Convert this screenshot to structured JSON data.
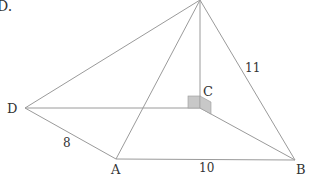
{
  "problem_marker": "D.",
  "diagram": {
    "type": "pyramid",
    "vertices": {
      "apex": {
        "label": "",
        "x": 200,
        "y": 0
      },
      "A": {
        "label": "A",
        "x": 116,
        "y": 159
      },
      "B": {
        "label": "B",
        "x": 295,
        "y": 160
      },
      "C": {
        "label": "C",
        "x": 200,
        "y": 108
      },
      "D": {
        "label": "D",
        "x": 25,
        "y": 108
      }
    },
    "edges": [
      {
        "from": "apex",
        "to": "D"
      },
      {
        "from": "apex",
        "to": "A"
      },
      {
        "from": "apex",
        "to": "C"
      },
      {
        "from": "apex",
        "to": "B"
      },
      {
        "from": "D",
        "to": "C"
      },
      {
        "from": "D",
        "to": "A"
      },
      {
        "from": "A",
        "to": "B"
      },
      {
        "from": "C",
        "to": "B"
      }
    ],
    "measurements": {
      "DA": "8",
      "AB": "10",
      "apexB": "11"
    },
    "right_angle_marker": {
      "at": "C",
      "fill_color": "#c8c8c8"
    },
    "colors": {
      "edge": "#9a9a9a",
      "text": "#333333"
    }
  }
}
